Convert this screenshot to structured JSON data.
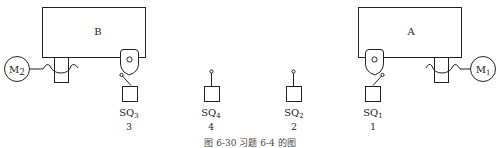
{
  "figure": {
    "caption": "图 6-30  习题 6-4 的图"
  },
  "tables": [
    {
      "id": "B",
      "label": "B",
      "motor": {
        "label": "M",
        "subscript": "2"
      }
    },
    {
      "id": "A",
      "label": "A",
      "motor": {
        "label": "M",
        "subscript": "1"
      }
    }
  ],
  "switches": [
    {
      "label": "SQ",
      "subscript": "3",
      "position": "3"
    },
    {
      "label": "SQ",
      "subscript": "4",
      "position": "4"
    },
    {
      "label": "SQ",
      "subscript": "2",
      "position": "2"
    },
    {
      "label": "SQ",
      "subscript": "1",
      "position": "1"
    }
  ]
}
